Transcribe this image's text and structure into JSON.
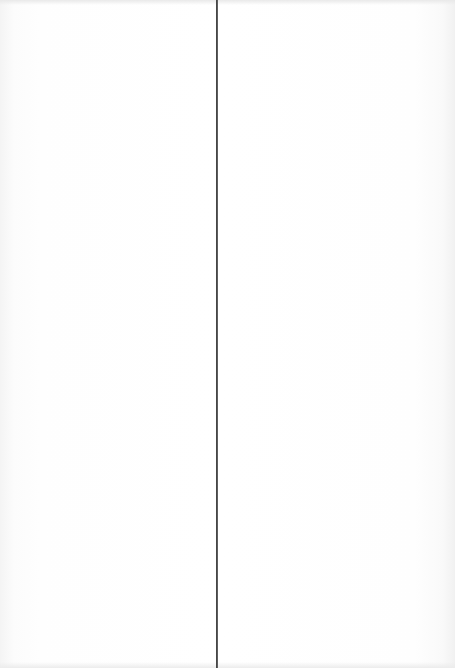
{
  "document": {
    "type": "scanned-page-spread",
    "pages": [
      {
        "side": "left",
        "content": ""
      },
      {
        "side": "right",
        "content": ""
      }
    ],
    "gutter_color": "#3a3a3a",
    "background_color": "#ffffff"
  }
}
